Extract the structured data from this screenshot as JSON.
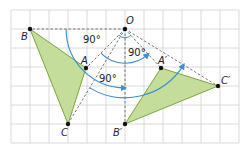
{
  "diagram": {
    "colors": {
      "grid": "#d0d0d0",
      "triangle_fill": "#c5dd9a",
      "triangle_stroke": "#7aa63c",
      "dashed": "#555555",
      "arc": "#3a8fd0",
      "point": "#111111"
    },
    "grid": {
      "x0": 11,
      "y0": 10,
      "cell": 19,
      "cols": 12,
      "rows": 7
    },
    "points": {
      "O": {
        "label": "O",
        "x": 125,
        "y": 29,
        "lx": 126,
        "ly": 24
      },
      "B": {
        "label": "B",
        "x": 30,
        "y": 29,
        "lx": 21,
        "ly": 40
      },
      "A": {
        "label": "A",
        "x": 86,
        "y": 68,
        "lx": 81,
        "ly": 64
      },
      "C": {
        "label": "C",
        "x": 68,
        "y": 124,
        "lx": 61,
        "ly": 136
      },
      "A_prime": {
        "label": "A′",
        "x": 161,
        "y": 68,
        "lx": 158,
        "ly": 64
      },
      "B_prime": {
        "label": "B′",
        "x": 125,
        "y": 124,
        "lx": 113,
        "ly": 136
      },
      "C_prime": {
        "label": "C′",
        "x": 218,
        "y": 86,
        "lx": 221,
        "ly": 84
      }
    },
    "original_triangle": {
      "name": "ABC",
      "vertices": [
        "A",
        "B",
        "C"
      ]
    },
    "image_triangle": {
      "name": "A′B′C′",
      "vertices": [
        "A_prime",
        "B_prime",
        "C_prime"
      ]
    },
    "angle_labels": [
      {
        "text": "90°",
        "x": 83,
        "y": 43
      },
      {
        "text": "90°",
        "x": 128,
        "y": 56
      },
      {
        "text": "90°",
        "x": 99,
        "y": 82
      }
    ],
    "rotation": {
      "center": "O",
      "angle": "90°",
      "direction": "counterclockwise-to-clockwise arrows shown"
    }
  }
}
